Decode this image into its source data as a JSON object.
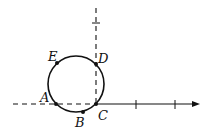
{
  "diagram": {
    "points": {
      "A": {
        "label": "A",
        "x": 56,
        "y": 104
      },
      "B": {
        "label": "B",
        "x": 83,
        "y": 113
      },
      "C": {
        "label": "C",
        "x": 96,
        "y": 104
      },
      "D": {
        "label": "D",
        "x": 96,
        "y": 64
      },
      "E": {
        "label": "E",
        "x": 57,
        "y": 63
      }
    },
    "circle": {
      "cx": 76,
      "cy": 84,
      "r": 28
    },
    "horizontal_axis": {
      "y": 104,
      "dashed_from": 13,
      "dashed_to": 96,
      "solid_to": 199,
      "ticks": [
        136,
        175
      ]
    },
    "vertical_axis": {
      "x": 96,
      "from": 8,
      "to": 104,
      "ticks": [
        23
      ]
    },
    "colors": {
      "stroke": "#111111"
    }
  }
}
